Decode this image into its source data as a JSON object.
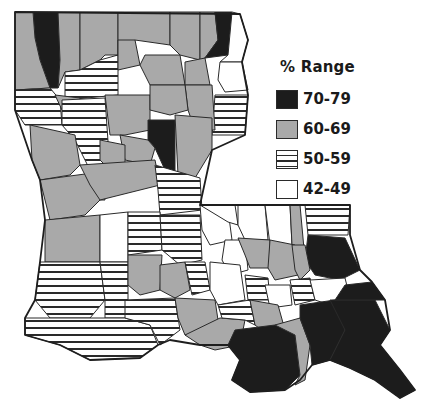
{
  "legend": {
    "title": "% Range",
    "items": [
      {
        "label": "70-79",
        "fill": "#1c1c1c",
        "pattern": "solid"
      },
      {
        "label": "60-69",
        "fill": "#a9a9a9",
        "pattern": "solid"
      },
      {
        "label": "50-59",
        "fill": "#ffffff",
        "pattern": "horizontal-lines"
      },
      {
        "label": "42-49",
        "fill": "#ffffff",
        "pattern": "none"
      }
    ]
  },
  "chart_data": {
    "type": "choropleth",
    "title": "",
    "region": "Louisiana parishes",
    "legend_title": "% Range",
    "classes": [
      "70-79",
      "60-69",
      "50-59",
      "42-49"
    ],
    "parishes": [
      {
        "id": "caddo",
        "class": "70-79",
        "points": "33,12 58,12 60,60 58,88 50,88 40,60 35,38"
      },
      {
        "id": "bossier",
        "class": "60-69",
        "points": "58,12 80,12 80,70 65,72 58,88 60,60"
      },
      {
        "id": "de-soto-north",
        "class": "60-69",
        "points": "15,12 33,12 35,38 40,60 50,88 15,90"
      },
      {
        "id": "webster",
        "class": "60-69",
        "points": "80,12 118,12 118,55 105,55 100,60 80,70"
      },
      {
        "id": "claiborne",
        "class": "60-69",
        "points": "118,12 170,12 170,45 135,40 118,55"
      },
      {
        "id": "union",
        "class": "60-69",
        "points": "170,12 200,12 200,60 180,55 170,45"
      },
      {
        "id": "morehouse",
        "class": "60-69",
        "points": "200,12 215,12 218,40 205,58 200,60"
      },
      {
        "id": "east-carroll",
        "class": "70-79",
        "points": "215,12 232,12 228,55 205,58 218,40"
      },
      {
        "id": "west-carroll",
        "class": "42-49",
        "points": "232,12 240,14 248,40 242,62 220,62 228,55"
      },
      {
        "id": "bienville",
        "class": "50-59",
        "points": "80,70 100,60 118,55 118,95 65,100 65,72"
      },
      {
        "id": "lincoln",
        "class": "60-69",
        "points": "118,40 135,40 140,65 118,70 118,55"
      },
      {
        "id": "ouachita",
        "class": "60-69",
        "points": "145,55 180,55 185,85 150,85 140,65"
      },
      {
        "id": "richland",
        "class": "60-69",
        "points": "185,62 205,58 210,85 185,85"
      },
      {
        "id": "madison",
        "class": "42-49",
        "points": "220,62 242,62 248,90 225,92 218,80"
      },
      {
        "id": "tensas",
        "class": "50-59",
        "points": "215,95 248,95 245,135 212,135"
      },
      {
        "id": "franklin",
        "class": "60-69",
        "points": "185,85 212,85 215,130 195,130 188,110"
      },
      {
        "id": "sabine-north",
        "class": "50-59",
        "points": "15,90 50,88 60,100 62,125 25,125 15,110"
      },
      {
        "id": "red-river",
        "class": "60-69",
        "points": "55,95 80,98 80,120 70,118 62,110"
      },
      {
        "id": "natchitoches",
        "class": "50-59",
        "points": "62,100 105,98 110,170 90,170 75,140 62,125"
      },
      {
        "id": "winn",
        "class": "60-69",
        "points": "105,95 150,95 150,130 125,135 110,135"
      },
      {
        "id": "caldwell",
        "class": "60-69",
        "points": "150,85 185,85 188,110 170,115 150,110"
      },
      {
        "id": "catahoula",
        "class": "70-79",
        "points": "148,120 175,120 175,175 165,170 155,148 148,140"
      },
      {
        "id": "la-salle",
        "class": "60-69",
        "points": "120,135 148,140 155,148 150,165 125,160"
      },
      {
        "id": "concordia",
        "class": "60-69",
        "points": "175,115 212,118 212,150 195,178 178,175"
      },
      {
        "id": "sabine",
        "class": "60-69",
        "points": "30,125 75,135 80,165 70,175 40,180 32,160"
      },
      {
        "id": "vernon",
        "class": "60-69",
        "points": "40,180 100,172 105,200 100,200 85,215 50,220 45,200"
      },
      {
        "id": "grant",
        "class": "60-69",
        "points": "100,140 125,145 125,165 110,170 100,160"
      },
      {
        "id": "rapides",
        "class": "60-69",
        "points": "80,165 155,160 160,185 120,195 100,200 90,185"
      },
      {
        "id": "avoyelles",
        "class": "50-59",
        "points": "155,165 200,178 202,210 160,215 158,190"
      },
      {
        "id": "beauregard",
        "class": "60-69",
        "points": "45,220 100,215 100,262 45,262"
      },
      {
        "id": "allen",
        "class": "42-49",
        "points": "100,215 128,212 128,262 100,262"
      },
      {
        "id": "evangeline",
        "class": "50-59",
        "points": "128,212 160,212 162,250 128,255"
      },
      {
        "id": "st-landry",
        "class": "50-59",
        "points": "160,215 200,215 202,260 180,265 162,250"
      },
      {
        "id": "pointe-coupee",
        "class": "42-49",
        "points": "200,205 228,210 232,240 210,245 202,230"
      },
      {
        "id": "west-feliciana",
        "class": "42-49",
        "points": "200,205 235,205 238,225 228,222"
      },
      {
        "id": "east-feliciana",
        "class": "42-49",
        "points": "238,205 265,205 268,240 245,240 238,225"
      },
      {
        "id": "st-helena",
        "class": "42-49",
        "points": "265,205 290,205 292,245 270,245"
      },
      {
        "id": "washington",
        "class": "60-69",
        "points": "290,205 300,205 305,260 295,270 292,245"
      },
      {
        "id": "st-tammany-north",
        "class": "50-59",
        "points": "305,205 350,205 348,235 308,235"
      },
      {
        "id": "st-tammany",
        "class": "70-79",
        "points": "308,235 345,238 360,270 340,280 315,275 305,260"
      },
      {
        "id": "west-baton-rouge",
        "class": "42-49",
        "points": "225,240 245,240 248,270 230,275 222,260"
      },
      {
        "id": "east-baton-rouge",
        "class": "60-69",
        "points": "238,238 270,240 270,268 250,268 245,255"
      },
      {
        "id": "livingston",
        "class": "60-69",
        "points": "270,240 295,245 298,275 275,280 268,268"
      },
      {
        "id": "tangipahoa",
        "class": "60-69",
        "points": "292,245 305,245 310,270 300,280 295,270"
      },
      {
        "id": "calcasieu",
        "class": "50-59",
        "points": "40,262 100,262 105,300 90,318 50,318 35,300"
      },
      {
        "id": "jeff-davis",
        "class": "50-59",
        "points": "100,262 128,262 128,318 105,318 105,300"
      },
      {
        "id": "acadia",
        "class": "60-69",
        "points": "128,255 162,255 160,290 140,295 128,285"
      },
      {
        "id": "lafayette",
        "class": "60-69",
        "points": "160,265 185,262 190,290 175,298 160,290"
      },
      {
        "id": "st-martin-north",
        "class": "50-59",
        "points": "185,262 205,262 210,290 192,295"
      },
      {
        "id": "iberville",
        "class": "42-49",
        "points": "210,262 240,265 245,300 218,305 210,290"
      },
      {
        "id": "ascension",
        "class": "50-59",
        "points": "245,275 268,278 270,300 248,300"
      },
      {
        "id": "st-james",
        "class": "42-49",
        "points": "265,285 290,285 292,305 270,308"
      },
      {
        "id": "st-john",
        "class": "50-59",
        "points": "290,280 310,278 315,300 295,305"
      },
      {
        "id": "orleans",
        "class": "42-49",
        "points": "310,280 345,278 350,298 330,305 315,300"
      },
      {
        "id": "cameron",
        "class": "50-59",
        "points": "25,318 125,318 150,325 158,345 140,358 90,360 60,345 25,335"
      },
      {
        "id": "vermilion",
        "class": "50-59",
        "points": "125,300 175,298 180,330 160,345 150,325 125,318"
      },
      {
        "id": "iberia",
        "class": "60-69",
        "points": "175,298 215,300 218,320 200,335 185,335 178,318"
      },
      {
        "id": "st-mary",
        "class": "60-69",
        "points": "185,335 220,318 245,320 240,345 215,350 200,345"
      },
      {
        "id": "assumption",
        "class": "50-59",
        "points": "218,305 250,300 255,325 245,320 222,318"
      },
      {
        "id": "lafourche-north",
        "class": "60-69",
        "points": "250,300 278,305 285,330 268,335 255,325"
      },
      {
        "id": "terrebonne",
        "class": "70-79",
        "points": "235,330 275,325 295,335 300,375 285,390 250,392 232,380 240,360 228,345"
      },
      {
        "id": "lafourche",
        "class": "60-69",
        "points": "275,325 300,318 310,345 305,380 295,385 300,375 295,335"
      },
      {
        "id": "jefferson",
        "class": "70-79",
        "points": "300,305 335,300 345,330 330,360 312,365 310,345 300,318"
      },
      {
        "id": "plaquemines",
        "class": "70-79",
        "points": "330,300 375,300 390,330 380,345 400,370 415,390 400,398 375,380 350,368 330,360 345,330"
      },
      {
        "id": "st-bernard",
        "class": "70-79",
        "points": "345,285 372,282 385,300 375,300 335,300"
      }
    ],
    "outline_state": "Louisiana"
  }
}
